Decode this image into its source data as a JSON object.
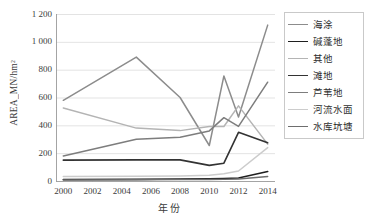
{
  "chart_data": {
    "type": "line",
    "title": "",
    "xlabel": "年份",
    "ylabel": "AREA_MN/hm²",
    "x": [
      2000,
      2005,
      2008,
      2010,
      2011,
      2012,
      2014
    ],
    "xlim": [
      1999.5,
      2014.5
    ],
    "ylim": [
      0,
      1200
    ],
    "xticks": [
      "2000",
      "2002",
      "2004",
      "2006",
      "2008",
      "2010",
      "2012",
      "2014"
    ],
    "xtick_values": [
      2000,
      2002,
      2004,
      2006,
      2008,
      2010,
      2012,
      2014
    ],
    "yticks": [
      "0",
      "200",
      "400",
      "600",
      "800",
      "1 000",
      "1 200"
    ],
    "ytick_values": [
      0,
      200,
      400,
      600,
      800,
      1000,
      1200
    ],
    "grid": "horizontal",
    "legend_position": "right",
    "series": [
      {
        "name": "海涂",
        "color": "#8c8c8c",
        "width": 1.5,
        "values": [
          580,
          890,
          600,
          255,
          755,
          460,
          1120
        ]
      },
      {
        "name": "碱蓬地",
        "color": "#1f1f1f",
        "width": 1.6,
        "values": [
          10,
          12,
          14,
          16,
          18,
          22,
          68
        ]
      },
      {
        "name": "其他",
        "color": "#b4b4b4",
        "width": 1.5,
        "values": [
          525,
          380,
          362,
          392,
          392,
          540,
          265
        ]
      },
      {
        "name": "滩地",
        "color": "#333333",
        "width": 1.6,
        "values": [
          150,
          152,
          152,
          112,
          128,
          350,
          275
        ]
      },
      {
        "name": "芦苇地",
        "color": "#7d7d7d",
        "width": 1.5,
        "values": [
          180,
          300,
          315,
          360,
          455,
          392,
          710
        ]
      },
      {
        "name": "河流水面",
        "color": "#cccccc",
        "width": 1.5,
        "values": [
          32,
          34,
          36,
          42,
          52,
          72,
          240
        ]
      },
      {
        "name": "水库坑塘",
        "color": "#6e6e6e",
        "width": 1.4,
        "values": [
          8,
          9,
          10,
          11,
          12,
          14,
          32
        ]
      }
    ]
  }
}
